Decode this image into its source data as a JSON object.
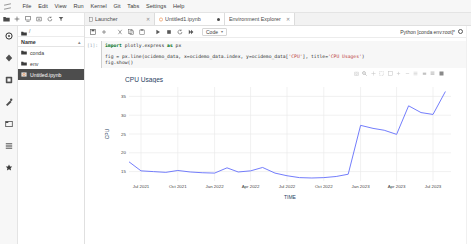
{
  "app": {
    "logo": "jupyter-logo",
    "menu": [
      "File",
      "Edit",
      "View",
      "Run",
      "Kernel",
      "Git",
      "Tabs",
      "Settings",
      "Help"
    ]
  },
  "main_toolbar": {
    "icons": [
      "folder-icon",
      "new-launcher-icon",
      "upload-icon",
      "new-folder-icon",
      "refresh-icon",
      "filter-icon"
    ]
  },
  "tabs": [
    {
      "label": "Launcher",
      "icon": "launcher-icon",
      "close": "✕",
      "active": false,
      "dirty": false
    },
    {
      "label": "Untitled1.ipynb",
      "icon": "notebook-icon",
      "close": "✕",
      "active": true,
      "dirty": true
    },
    {
      "label": "Environment Explorer",
      "icon": "",
      "close": "✕",
      "active": false,
      "dirty": false
    }
  ],
  "rail": {
    "items": [
      {
        "name": "file-browser-icon",
        "active": true
      },
      {
        "name": "running-terminals-icon",
        "active": false
      },
      {
        "name": "git-icon",
        "active": false
      },
      {
        "name": "debugger-icon",
        "active": false
      },
      {
        "name": "open-tabs-icon",
        "active": false
      },
      {
        "name": "table-of-contents-icon",
        "active": false
      },
      {
        "name": "extension-manager-icon",
        "active": false
      }
    ]
  },
  "file_browser": {
    "breadcrumb": "/",
    "column_header": "Name",
    "sort_caret": "▴",
    "items": [
      {
        "label": "conda",
        "icon": "folder-icon",
        "selected": false
      },
      {
        "label": "env",
        "icon": "folder-icon",
        "selected": false
      },
      {
        "label": "Untitled.ipynb",
        "icon": "notebook-icon",
        "selected": true
      }
    ]
  },
  "notebook_toolbar": {
    "buttons": [
      "save-icon",
      "add-cell-icon",
      "cut-icon",
      "copy-icon",
      "paste-icon",
      "run-icon",
      "stop-icon",
      "restart-icon",
      "restart-run-all-icon"
    ],
    "cell_type": "Code",
    "cell_type_caret": "▾",
    "kernel_label": "Python [conda env:root]*",
    "kernel_status": "kernel-idle-icon"
  },
  "cell": {
    "prompt": "[1]:",
    "code_lines": [
      "import plotly.express as px",
      "",
      "fig = px.line(ocidemo_data, x=ocidemo_data.index, y=ocidemo_data['CPU'], title='CPU Usages')",
      "fig.show()"
    ]
  },
  "modebar": {
    "icons": [
      "camera-icon",
      "zoom-icon",
      "pan-icon",
      "box-select-icon",
      "lasso-select-icon",
      "zoom-in-icon",
      "zoom-out-icon",
      "autoscale-icon",
      "reset-axes-icon",
      "toggle-spikelines-icon",
      "hover-compare-icon",
      "plotly-logo-icon"
    ]
  },
  "chart_data": {
    "type": "line",
    "title": "CPU Usages",
    "xlabel": "TIME",
    "ylabel": "CPU",
    "grid": true,
    "legend": null,
    "xtick_labels": [
      "Jul 2021",
      "Oct 2021",
      "Jan 2022",
      "Apr 2022",
      "Jul 2022",
      "Oct 2022",
      "Jan 2023",
      "Apr 2023",
      "Jul 2023"
    ],
    "ytick_labels": [
      "15",
      "20",
      "25",
      "30",
      "35"
    ],
    "ylim": [
      12.5,
      37.5
    ],
    "xlim": [
      "2021-06-01",
      "2023-08-15"
    ],
    "line_color": "#636efa",
    "series": [
      {
        "name": "CPU",
        "x": [
          "2021-06-01",
          "2021-07-01",
          "2021-08-01",
          "2021-09-01",
          "2021-10-01",
          "2021-11-01",
          "2021-12-01",
          "2022-01-01",
          "2022-02-01",
          "2022-03-01",
          "2022-04-01",
          "2022-05-01",
          "2022-06-01",
          "2022-07-01",
          "2022-08-01",
          "2022-09-01",
          "2022-10-01",
          "2022-11-01",
          "2022-12-01",
          "2023-01-01",
          "2023-02-01",
          "2023-03-01",
          "2023-04-01",
          "2023-05-01",
          "2023-06-01",
          "2023-07-01",
          "2023-08-01"
        ],
        "y": [
          17.6,
          15.2,
          15.0,
          14.8,
          15.3,
          14.9,
          14.7,
          14.6,
          16.0,
          14.9,
          15.2,
          16.1,
          14.6,
          13.9,
          13.4,
          13.3,
          13.4,
          13.7,
          14.3,
          27.3,
          26.5,
          26.0,
          24.9,
          32.5,
          30.7,
          30.2,
          36.3
        ]
      }
    ],
    "annotations": []
  }
}
